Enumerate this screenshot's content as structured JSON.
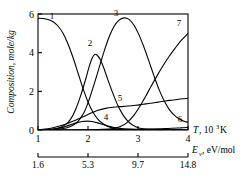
{
  "chart_data": {
    "type": "line",
    "title": "",
    "xlabel": "T, 10^3 K",
    "ylabel": "Composition, mole/kg",
    "xlim": [
      1,
      4
    ],
    "ylim": [
      0,
      6
    ],
    "grid": false,
    "legend": "inline-curve-numbers",
    "y_ticks": [
      "0",
      "2",
      "4",
      "6"
    ],
    "y_tick_values": [
      0,
      2,
      4,
      6
    ],
    "x_ticks": [
      "1",
      "2",
      "3",
      "4"
    ],
    "x_tick_values": [
      1,
      2,
      3,
      4
    ],
    "secondary_axis": {
      "label": "E_v, eV/mol",
      "label_base": "E",
      "label_sub": "v",
      "label_unit": ", eV/mol",
      "ticks": [
        "1.6",
        "5.3",
        "9.7",
        "14.8"
      ],
      "tick_values": [
        1.6,
        5.3,
        9.7,
        14.8
      ],
      "tick_at_x": [
        1,
        2,
        3,
        4
      ]
    },
    "axis_label_parts": {
      "x_base": "T",
      "x_unit": ", 10",
      "x_exp": "3",
      "x_unit_tail": " K"
    },
    "series": [
      {
        "name": "1",
        "label": "1",
        "label_x": 1.28,
        "label_y": 5.72,
        "points": [
          [
            1.0,
            5.78
          ],
          [
            1.1,
            5.77
          ],
          [
            1.2,
            5.72
          ],
          [
            1.3,
            5.6
          ],
          [
            1.4,
            5.38
          ],
          [
            1.5,
            5.0
          ],
          [
            1.6,
            4.45
          ],
          [
            1.7,
            3.75
          ],
          [
            1.8,
            2.95
          ],
          [
            1.9,
            2.15
          ],
          [
            2.0,
            1.45
          ],
          [
            2.1,
            0.92
          ],
          [
            2.2,
            0.55
          ],
          [
            2.3,
            0.32
          ],
          [
            2.4,
            0.18
          ],
          [
            2.5,
            0.1
          ],
          [
            2.6,
            0.05
          ],
          [
            2.8,
            0.02
          ],
          [
            3.0,
            0.01
          ],
          [
            3.5,
            0.0
          ],
          [
            4.0,
            0.0
          ]
        ]
      },
      {
        "name": "2",
        "label": "2",
        "label_x": 2.04,
        "label_y": 4.32,
        "points": [
          [
            1.0,
            0.0
          ],
          [
            1.2,
            0.02
          ],
          [
            1.4,
            0.1
          ],
          [
            1.55,
            0.28
          ],
          [
            1.65,
            0.55
          ],
          [
            1.75,
            1.05
          ],
          [
            1.85,
            1.75
          ],
          [
            1.95,
            2.6
          ],
          [
            2.02,
            3.25
          ],
          [
            2.08,
            3.7
          ],
          [
            2.13,
            3.9
          ],
          [
            2.18,
            3.88
          ],
          [
            2.25,
            3.62
          ],
          [
            2.32,
            3.18
          ],
          [
            2.4,
            2.58
          ],
          [
            2.5,
            1.88
          ],
          [
            2.6,
            1.25
          ],
          [
            2.7,
            0.78
          ],
          [
            2.8,
            0.45
          ],
          [
            2.9,
            0.25
          ],
          [
            3.0,
            0.12
          ],
          [
            3.15,
            0.05
          ],
          [
            3.4,
            0.02
          ],
          [
            4.0,
            0.0
          ]
        ]
      },
      {
        "name": "3",
        "label": "3",
        "label_x": 2.56,
        "label_y": 5.92,
        "points": [
          [
            1.0,
            0.0
          ],
          [
            1.2,
            0.01
          ],
          [
            1.45,
            0.05
          ],
          [
            1.65,
            0.18
          ],
          [
            1.8,
            0.45
          ],
          [
            1.92,
            0.9
          ],
          [
            2.02,
            1.55
          ],
          [
            2.12,
            2.35
          ],
          [
            2.22,
            3.2
          ],
          [
            2.32,
            4.05
          ],
          [
            2.42,
            4.8
          ],
          [
            2.52,
            5.35
          ],
          [
            2.62,
            5.68
          ],
          [
            2.72,
            5.8
          ],
          [
            2.82,
            5.72
          ],
          [
            2.92,
            5.42
          ],
          [
            3.02,
            4.92
          ],
          [
            3.12,
            4.28
          ],
          [
            3.22,
            3.55
          ],
          [
            3.32,
            2.8
          ],
          [
            3.42,
            2.1
          ],
          [
            3.52,
            1.52
          ],
          [
            3.62,
            1.08
          ],
          [
            3.72,
            0.78
          ],
          [
            3.82,
            0.58
          ],
          [
            3.92,
            0.45
          ],
          [
            4.0,
            0.4
          ]
        ]
      },
      {
        "name": "4",
        "label": "4",
        "label_x": 2.36,
        "label_y": 0.52,
        "points": [
          [
            1.0,
            0.0
          ],
          [
            1.2,
            0.02
          ],
          [
            1.4,
            0.08
          ],
          [
            1.55,
            0.18
          ],
          [
            1.68,
            0.3
          ],
          [
            1.78,
            0.38
          ],
          [
            1.88,
            0.44
          ],
          [
            1.98,
            0.46
          ],
          [
            2.08,
            0.44
          ],
          [
            2.18,
            0.38
          ],
          [
            2.28,
            0.3
          ],
          [
            2.4,
            0.2
          ],
          [
            2.55,
            0.12
          ],
          [
            2.7,
            0.06
          ],
          [
            2.9,
            0.03
          ],
          [
            3.2,
            0.01
          ],
          [
            4.0,
            0.0
          ]
        ]
      },
      {
        "name": "5",
        "label": "5",
        "label_x": 2.64,
        "label_y": 1.52,
        "points": [
          [
            1.0,
            0.0
          ],
          [
            1.15,
            0.05
          ],
          [
            1.3,
            0.12
          ],
          [
            1.45,
            0.22
          ],
          [
            1.6,
            0.35
          ],
          [
            1.75,
            0.5
          ],
          [
            1.9,
            0.68
          ],
          [
            2.05,
            0.86
          ],
          [
            2.2,
            1.02
          ],
          [
            2.35,
            1.12
          ],
          [
            2.5,
            1.18
          ],
          [
            2.65,
            1.21
          ],
          [
            2.8,
            1.24
          ],
          [
            2.95,
            1.28
          ],
          [
            3.1,
            1.33
          ],
          [
            3.25,
            1.38
          ],
          [
            3.4,
            1.44
          ],
          [
            3.55,
            1.5
          ],
          [
            3.7,
            1.55
          ],
          [
            3.85,
            1.6
          ],
          [
            4.0,
            1.64
          ]
        ]
      },
      {
        "name": "6",
        "label": "6",
        "label_x": 3.84,
        "label_y": 0.42,
        "points": [
          [
            1.0,
            0.0
          ],
          [
            1.5,
            0.0
          ],
          [
            2.0,
            0.01
          ],
          [
            2.4,
            0.02
          ],
          [
            2.8,
            0.03
          ],
          [
            3.1,
            0.04
          ],
          [
            3.4,
            0.06
          ],
          [
            3.6,
            0.08
          ],
          [
            3.8,
            0.1
          ],
          [
            3.9,
            0.12
          ],
          [
            4.0,
            0.13
          ]
        ]
      },
      {
        "name": "7",
        "label": "7",
        "label_x": 3.82,
        "label_y": 5.38,
        "points": [
          [
            1.0,
            0.0
          ],
          [
            1.6,
            0.0
          ],
          [
            2.0,
            0.01
          ],
          [
            2.3,
            0.03
          ],
          [
            2.5,
            0.08
          ],
          [
            2.65,
            0.18
          ],
          [
            2.78,
            0.38
          ],
          [
            2.9,
            0.7
          ],
          [
            3.02,
            1.15
          ],
          [
            3.14,
            1.68
          ],
          [
            3.26,
            2.25
          ],
          [
            3.38,
            2.8
          ],
          [
            3.5,
            3.32
          ],
          [
            3.62,
            3.8
          ],
          [
            3.74,
            4.22
          ],
          [
            3.86,
            4.62
          ],
          [
            4.0,
            5.0
          ]
        ]
      }
    ]
  }
}
